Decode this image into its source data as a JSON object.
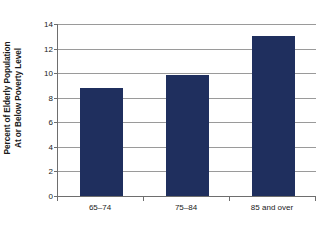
{
  "chart_data": {
    "type": "bar",
    "title": "",
    "subtitle": "",
    "xlabel": "",
    "ylabel_lines": [
      "Percent of Elderly Population",
      "At or Below Poverty Level"
    ],
    "ylabel": "Percent of Elderly Population At or Below Poverty Level",
    "categories": [
      "65–74",
      "75–84",
      "85 and over"
    ],
    "values": [
      8.8,
      9.85,
      13.05
    ],
    "ylim": [
      0,
      14
    ],
    "ytick_labels": [
      "0",
      "2",
      "4",
      "6",
      "8",
      "10",
      "12",
      "14"
    ],
    "ytick_values": [
      0,
      2,
      4,
      6,
      8,
      10,
      12,
      14
    ],
    "grid": true,
    "legend": false,
    "legend_position": "none",
    "bar_color": "#1f2f5e",
    "axis_color": "#6e6e6e",
    "gridline_color": "#9a9a9a",
    "background_color": "#ffffff"
  }
}
